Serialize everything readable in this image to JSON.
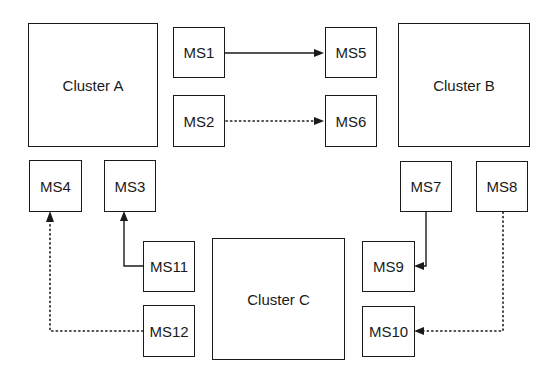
{
  "diagram": {
    "background_color": "#ffffff",
    "stroke_color": "#1a1a1a",
    "width": 554,
    "height": 380
  },
  "clusters": [
    {
      "id": "cluster-a",
      "label": "Cluster A",
      "x": 28,
      "y": 23,
      "w": 130,
      "h": 124
    },
    {
      "id": "cluster-b",
      "label": "Cluster B",
      "x": 398,
      "y": 23,
      "w": 132,
      "h": 124
    },
    {
      "id": "cluster-c",
      "label": "Cluster C",
      "x": 212,
      "y": 238,
      "w": 133,
      "h": 122
    }
  ],
  "services": [
    {
      "id": "ms1",
      "label": "MS1",
      "x": 173,
      "y": 27,
      "w": 52,
      "h": 51
    },
    {
      "id": "ms2",
      "label": "MS2",
      "x": 173,
      "y": 95,
      "w": 52,
      "h": 52
    },
    {
      "id": "ms3",
      "label": "MS3",
      "x": 104,
      "y": 160,
      "w": 52,
      "h": 52
    },
    {
      "id": "ms4",
      "label": "MS4",
      "x": 29,
      "y": 160,
      "w": 53,
      "h": 52
    },
    {
      "id": "ms5",
      "label": "MS5",
      "x": 325,
      "y": 27,
      "w": 52,
      "h": 51
    },
    {
      "id": "ms6",
      "label": "MS6",
      "x": 325,
      "y": 95,
      "w": 52,
      "h": 52
    },
    {
      "id": "ms7",
      "label": "MS7",
      "x": 400,
      "y": 161,
      "w": 52,
      "h": 51
    },
    {
      "id": "ms8",
      "label": "MS8",
      "x": 476,
      "y": 161,
      "w": 52,
      "h": 51
    },
    {
      "id": "ms9",
      "label": "MS9",
      "x": 362,
      "y": 241,
      "w": 53,
      "h": 51
    },
    {
      "id": "ms10",
      "label": "MS10",
      "x": 362,
      "y": 306,
      "w": 53,
      "h": 51
    },
    {
      "id": "ms11",
      "label": "MS11",
      "x": 143,
      "y": 241,
      "w": 52,
      "h": 51
    },
    {
      "id": "ms12",
      "label": "MS12",
      "x": 143,
      "y": 305,
      "w": 52,
      "h": 52
    }
  ],
  "edges": [
    {
      "id": "edge-ms1-ms5",
      "from": "MS1",
      "to": "MS5",
      "style": "solid",
      "arrow": "right"
    },
    {
      "id": "edge-ms2-ms6",
      "from": "MS2",
      "to": "MS6",
      "style": "dotted",
      "arrow": "right"
    },
    {
      "id": "edge-ms11-ms3",
      "from": "MS11",
      "to": "MS3",
      "style": "solid",
      "arrow": "up"
    },
    {
      "id": "edge-ms12-ms4",
      "from": "MS12",
      "to": "MS4",
      "style": "dotted",
      "arrow": "up"
    },
    {
      "id": "edge-ms7-ms9",
      "from": "MS7",
      "to": "MS9",
      "style": "solid",
      "arrow": "left"
    },
    {
      "id": "edge-ms8-ms10",
      "from": "MS8",
      "to": "MS10",
      "style": "dotted",
      "arrow": "left"
    }
  ]
}
